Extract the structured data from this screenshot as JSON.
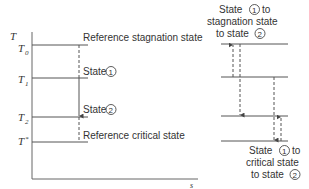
{
  "diagram": {
    "axis": {
      "y_label": "T",
      "x_label": "s"
    },
    "levels": [
      {
        "symbol": "T",
        "sub": "0",
        "name": "T0"
      },
      {
        "symbol": "T",
        "sub": "1",
        "name": "T1"
      },
      {
        "symbol": "T",
        "sub": "2",
        "name": "T2"
      },
      {
        "symbol": "T",
        "sub": "*",
        "name": "T*"
      }
    ],
    "left_labels": {
      "stagnation": "Reference stagnation state",
      "state1": "State",
      "state1_num": "1",
      "state2": "State",
      "state2_num": "2",
      "critical": "Reference critical state"
    },
    "right_top_caption": {
      "line1_a": "State",
      "line1_num": "1",
      "line1_b": "to",
      "line2": "stagnation state",
      "line3_a": "to state",
      "line3_num": "2"
    },
    "right_bottom_caption": {
      "line1_a": "State",
      "line1_num": "1",
      "line1_b": "to",
      "line2": "critical state",
      "line3_a": "to state",
      "line3_num": "2"
    },
    "colors": {
      "line": "#555555",
      "text": "#333333"
    }
  }
}
